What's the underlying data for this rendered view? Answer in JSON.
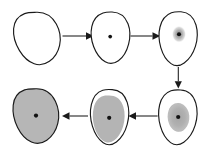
{
  "figure": {
    "width": 210,
    "height": 154,
    "background": "#ffffff",
    "outline_color": "#1a1a1a",
    "cell_fill": "#ffffff",
    "stain_gray": "#b6b6b6",
    "stain_gray_dark": "#a8a8a8",
    "nucleus_color": "#121212"
  },
  "stages": [
    {
      "id": "stage-1",
      "label": "1",
      "description": "empty cell, no nucleus marker",
      "has_nucleus_dot": false,
      "has_stain": false,
      "stain_extent": 0,
      "fill": "#ffffff",
      "position": "top-left"
    },
    {
      "id": "stage-2",
      "label": "2",
      "description": "cell with small central nucleus dot",
      "has_nucleus_dot": true,
      "has_stain": false,
      "stain_extent": 0,
      "fill": "#ffffff",
      "position": "top-center"
    },
    {
      "id": "stage-3",
      "label": "3",
      "description": "cell with nucleus dot and small gray stain halo",
      "has_nucleus_dot": true,
      "has_stain": true,
      "stain_extent": 1,
      "fill": "#ffffff",
      "position": "top-right"
    },
    {
      "id": "stage-4",
      "label": "4",
      "description": "cell with nucleus dot and medium gray stain region",
      "has_nucleus_dot": true,
      "has_stain": true,
      "stain_extent": 2,
      "fill": "#ffffff",
      "position": "bottom-right"
    },
    {
      "id": "stage-5",
      "label": "5",
      "description": "cell with nucleus dot and large gray stain filling most of cell",
      "has_nucleus_dot": true,
      "has_stain": true,
      "stain_extent": 3,
      "fill": "#ffffff",
      "position": "bottom-center"
    },
    {
      "id": "stage-6",
      "label": "6",
      "description": "cell completely filled with gray stain, nucleus dot visible",
      "has_nucleus_dot": true,
      "has_stain": true,
      "stain_extent": 4,
      "fill": "#b6b6b6",
      "position": "bottom-left"
    }
  ],
  "arrows": [
    {
      "id": "arrow-1-2",
      "from": "stage-1",
      "to": "stage-2",
      "direction": "right"
    },
    {
      "id": "arrow-2-3",
      "from": "stage-2",
      "to": "stage-3",
      "direction": "right"
    },
    {
      "id": "arrow-3-4",
      "from": "stage-3",
      "to": "stage-4",
      "direction": "down"
    },
    {
      "id": "arrow-4-5",
      "from": "stage-4",
      "to": "stage-5",
      "direction": "left"
    },
    {
      "id": "arrow-5-6",
      "from": "stage-5",
      "to": "stage-6",
      "direction": "left"
    }
  ]
}
